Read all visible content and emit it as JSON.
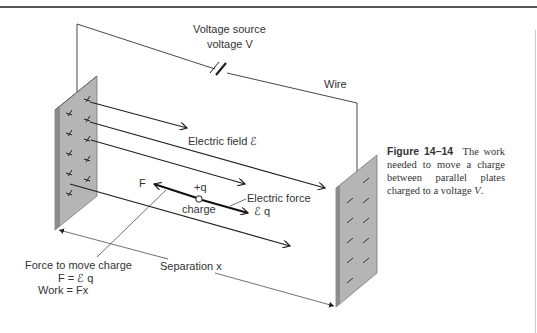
{
  "figure": {
    "labels": {
      "voltage_source": "Voltage source",
      "voltage_v": "voltage V",
      "wire": "Wire",
      "electric_field": "Electric field ℰ",
      "F": "F",
      "plus_q": "+q",
      "charge": "charge",
      "electric_force": "Electric force",
      "eq": "ℰ q",
      "force_to_move": "Force to move charge",
      "f_eq": "F = ℰ q",
      "work": "Work = Fx",
      "separation": "Separation x"
    },
    "left_plate_sign": "+",
    "right_plate_sign": "−",
    "colors": {
      "plate": "#b8b8b8",
      "plate_edge": "#888888",
      "line": "#222222"
    }
  },
  "caption": {
    "number": "Figure 14–14",
    "text": "The work needed to move a charge between parallel plates charged to a voltage",
    "variable": "V",
    "end": "."
  }
}
